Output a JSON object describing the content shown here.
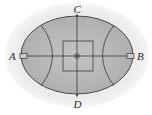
{
  "diagram": {
    "type": "ellipse-field-diagram",
    "labels": {
      "A": "A",
      "B": "B",
      "C": "C",
      "D": "D"
    },
    "colors": {
      "fill": "#b9b9b9",
      "stroke": "#3a3a3a",
      "background_halo": "#e6e6e6"
    },
    "elements": [
      "outer ellipse (shaded)",
      "horizontal axis A–B",
      "vertical axis C–D",
      "central square",
      "center point (small circle)",
      "left hyperbolic arc",
      "right hyperbolic arc",
      "small rectangle at A",
      "small rectangle at B"
    ]
  }
}
